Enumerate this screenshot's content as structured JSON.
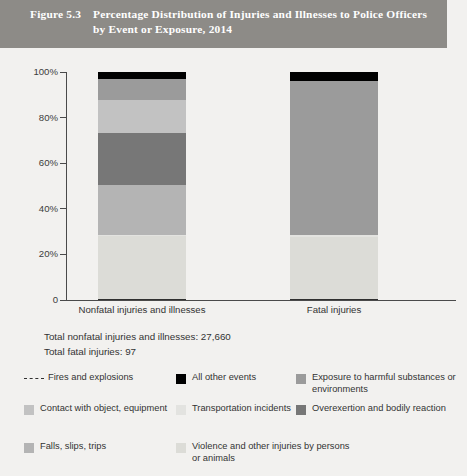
{
  "figure": {
    "number": "Figure 5.3",
    "title": "Percentage Distribution of Injuries and Illnesses to Police Officers by Event or Exposure, 2014",
    "band_color": "#8d8b87"
  },
  "totals": {
    "nonfatal": "Total nonfatal injuries and illnesses: 27,660",
    "fatal": "Total fatal injuries: 97"
  },
  "legend": {
    "items": [
      {
        "label": "Fires and explosions",
        "color": "#303030",
        "style": "dashed"
      },
      {
        "label": "All other events",
        "color": "#000000",
        "style": "box"
      },
      {
        "label": "Exposure to harmful substances or environments",
        "color": "#9b9b9b",
        "style": "box"
      },
      {
        "label": "Contact with object, equipment",
        "color": "#c2c2c2",
        "style": "box"
      },
      {
        "label": "Transportation incidents",
        "color": "#e3e3e0",
        "style": "box"
      },
      {
        "label": "Overexertion and bodily reaction",
        "color": "#777777",
        "style": "box"
      },
      {
        "label": "Falls, slips, trips",
        "color": "#b4b4b4",
        "style": "box"
      },
      {
        "label": "Violence and other injuries by persons or animals",
        "color": "#dcdcd7",
        "style": "box"
      }
    ]
  },
  "chart_data": {
    "type": "bar",
    "subtype": "stacked-100-percent",
    "title": "Percentage Distribution of Injuries and Illnesses to Police Officers by Event or Exposure, 2014",
    "xlabel": "",
    "ylabel": "",
    "ylim": [
      0,
      100
    ],
    "yticks": [
      0,
      20,
      40,
      60,
      80,
      100
    ],
    "ytick_labels": [
      "0",
      "20%",
      "40%",
      "60%",
      "80%",
      "100%"
    ],
    "grid": false,
    "legend_position": "bottom",
    "categories": [
      "Nonfatal injuries and illnesses",
      "Fatal injuries"
    ],
    "series": [
      {
        "name": "Fires and explosions",
        "color": "#303030",
        "values": [
          0.4,
          0.6
        ]
      },
      {
        "name": "Violence and other injuries by persons or animals",
        "color": "#dcdcd7",
        "values": [
          27.6,
          27.0
        ]
      },
      {
        "name": "Transportation incidents",
        "color": "#e3e3e0",
        "values": [
          0.7,
          0.7
        ]
      },
      {
        "name": "Falls, slips, trips",
        "color": "#b4b4b4",
        "values": [
          21.7,
          0.0
        ]
      },
      {
        "name": "Overexertion and bodily reaction",
        "color": "#777777",
        "values": [
          22.8,
          0.0
        ]
      },
      {
        "name": "Contact with object, equipment",
        "color": "#c2c2c2",
        "values": [
          14.5,
          0.0
        ]
      },
      {
        "name": "Exposure to harmful substances or environments",
        "color": "#9b9b9b",
        "values": [
          9.2,
          67.6
        ]
      },
      {
        "name": "All other events",
        "color": "#000000",
        "values": [
          3.1,
          4.1
        ]
      }
    ],
    "annotations": [
      "Total nonfatal injuries and illnesses: 27,660",
      "Total fatal injuries: 97"
    ]
  }
}
